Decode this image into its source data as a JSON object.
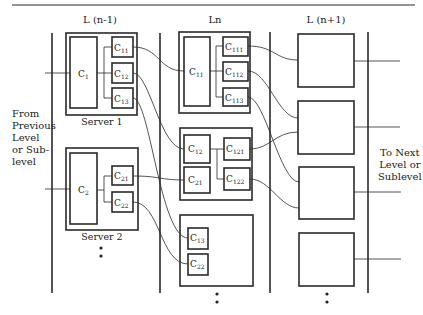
{
  "diagram": {
    "type": "hierarchical-server-level-diagram",
    "colors": {
      "line": "#2a2a2a",
      "background": "#ffffff"
    },
    "levels": [
      {
        "id": "L_prev",
        "label": "L (n-1)"
      },
      {
        "id": "L_n",
        "label": "Ln"
      },
      {
        "id": "L_next",
        "label": "L (n+1)"
      }
    ],
    "side_labels": {
      "left": [
        "From",
        "Previous",
        "Level",
        "or Sub-",
        "level"
      ],
      "right": [
        "To Next",
        "Level or",
        "Sublevel"
      ]
    },
    "servers": [
      {
        "name": "Server 1",
        "main": "C",
        "main_sub": "1",
        "children": [
          {
            "base": "C",
            "sub": "11"
          },
          {
            "base": "C",
            "sub": "12"
          },
          {
            "base": "C",
            "sub": "13"
          }
        ]
      },
      {
        "name": "Server 2",
        "main": "C",
        "main_sub": "2",
        "children": [
          {
            "base": "C",
            "sub": "21"
          },
          {
            "base": "C",
            "sub": "22"
          }
        ]
      }
    ],
    "ln_boxes": [
      {
        "main": {
          "base": "C",
          "sub": "11"
        },
        "children": [
          {
            "base": "C",
            "sub": "111"
          },
          {
            "base": "C",
            "sub": "112"
          },
          {
            "base": "C",
            "sub": "113"
          }
        ]
      },
      {
        "left": [
          {
            "base": "C",
            "sub": "12"
          },
          {
            "base": "C",
            "sub": "21"
          }
        ],
        "children": [
          {
            "base": "C",
            "sub": "121"
          },
          {
            "base": "C",
            "sub": "122"
          }
        ]
      },
      {
        "left": [
          {
            "base": "C",
            "sub": "13"
          },
          {
            "base": "C",
            "sub": "22"
          }
        ]
      }
    ],
    "next_level_boxes": 4,
    "continuation": "•\n•"
  }
}
